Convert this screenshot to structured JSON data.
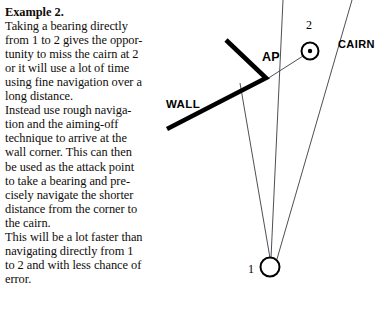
{
  "text": {
    "heading": "Example 2.",
    "paragraph1": "Taking a bearing directly\nfrom 1 to 2 gives the oppor-\ntunity to miss the cairn at 2\nor it will use a lot of time\nusing fine navigation over a\nlong distance.",
    "paragraph2": "Instead use rough naviga-\ntion and the aiming-off\ntechnique to arrive at the\nwall corner. This can then\nbe used as the attack point\nto take a bearing and pre-\ncisely navigate the shorter\ndistance from the corner to\nthe cairn.",
    "paragraph3": "This will be a lot faster than\nnavigating directly from 1\nto 2 and with less chance of error."
  },
  "diagram": {
    "labels": {
      "wall": "WALL",
      "attack_point": "AP",
      "cairn": "CAIRN",
      "point_two": "2",
      "point_one": "1"
    },
    "colors": {
      "ink": "#000000",
      "thin_line": "#3a3a42",
      "background": "#ffffff"
    },
    "geometry": {
      "wall_corner": [
        266,
        78
      ],
      "wall_upper_end": [
        226,
        40
      ],
      "wall_lower_end": [
        167,
        129
      ],
      "cairn_center": [
        310,
        51
      ],
      "cairn_radius": 8.5,
      "cairn_dot_radius": 2.2,
      "point_one_center": [
        270,
        267
      ],
      "point_one_radius": 9.5,
      "bearing_line_to_ap": [
        [
          270,
          258
        ],
        [
          240,
          83
        ]
      ],
      "bearing_line_direct": [
        [
          271,
          258
        ],
        [
          283,
          0
        ]
      ],
      "bearing_line_right": [
        [
          277,
          259
        ],
        [
          352,
          0
        ]
      ],
      "ap_to_cairn_line": [
        [
          267,
          79
        ],
        [
          302,
          56
        ]
      ]
    }
  }
}
